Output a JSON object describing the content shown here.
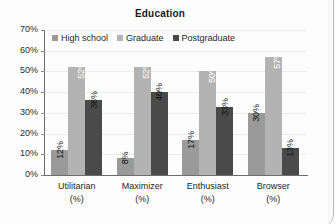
{
  "chart_data": {
    "type": "bar",
    "title": "Education",
    "xlabel": "",
    "ylabel": "",
    "ylim": [
      0,
      70
    ],
    "ytick_labels": [
      "70%",
      "60%",
      "50%",
      "40%",
      "30%",
      "20%",
      "10%",
      "0%"
    ],
    "ytick_values": [
      70,
      60,
      50,
      40,
      30,
      20,
      10,
      0
    ],
    "grid": true,
    "legend_position": "top-left-inside",
    "categories": [
      "Utilitarian",
      "Maximizer",
      "Enthusiast",
      "Browser"
    ],
    "category_sublabels": [
      "(%)",
      "(%)",
      "(%)",
      "(%)"
    ],
    "series": [
      {
        "name": "High school",
        "color": "#9a9a9a",
        "values": [
          12,
          8,
          17,
          30
        ],
        "labels": [
          "12%",
          "8%",
          "17%",
          "30%"
        ]
      },
      {
        "name": "Graduate",
        "color": "#b3b3b3",
        "values": [
          52,
          52,
          50,
          57
        ],
        "labels": [
          "52%",
          "52%",
          "50%",
          "57%"
        ]
      },
      {
        "name": "Postgraduate",
        "color": "#4a4a4a",
        "values": [
          36,
          40,
          33,
          13
        ],
        "labels": [
          "36%",
          "40%",
          "33%",
          "13%"
        ]
      }
    ]
  },
  "colors": {
    "axis": "#6d6d6d",
    "grid": "#ececec",
    "text": "#1f1f1f",
    "title": "#1a1a1a",
    "background": "#fdfdfd",
    "page_edge": "#b9b9b9"
  }
}
